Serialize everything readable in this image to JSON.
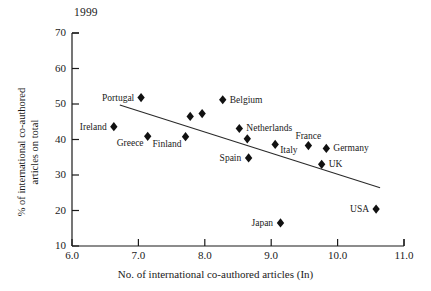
{
  "figure": {
    "year_title": "1999",
    "xlabel": "No. of international co-authored articles (In)",
    "ylabel": "% of international co-authored\narticles on total"
  },
  "chart_data": {
    "type": "scatter",
    "title": "1999",
    "xlabel": "No. of international co-authored articles (In)",
    "ylabel": "% of international co-authored articles on total",
    "xlim": [
      6.0,
      11.0
    ],
    "ylim": [
      10,
      70
    ],
    "xticks": [
      "6.0",
      "7.0",
      "8.0",
      "9.0",
      "10.0",
      "11.0"
    ],
    "yticks": [
      "10",
      "20",
      "30",
      "40",
      "50",
      "60",
      "70"
    ],
    "grid": false,
    "legend": "none",
    "points": [
      {
        "label": "Portugal",
        "x": 7.04,
        "y": 51.8,
        "label_pos": "left"
      },
      {
        "label": "Ireland",
        "x": 6.63,
        "y": 43.6,
        "label_pos": "left"
      },
      {
        "label": "Greece",
        "x": 7.14,
        "y": 40.9,
        "label_pos": "below-left"
      },
      {
        "label": "",
        "x": 7.78,
        "y": 46.5,
        "label_pos": "none"
      },
      {
        "label": "",
        "x": 7.96,
        "y": 47.3,
        "label_pos": "none"
      },
      {
        "label": "Finland",
        "x": 7.71,
        "y": 40.8,
        "label_pos": "below-left"
      },
      {
        "label": "Belgium",
        "x": 8.27,
        "y": 51.2,
        "label_pos": "right"
      },
      {
        "label": "Netherlands",
        "x": 8.52,
        "y": 43.1,
        "label_pos": "right"
      },
      {
        "label": "",
        "x": 8.64,
        "y": 40.2,
        "label_pos": "none"
      },
      {
        "label": "Spain",
        "x": 8.66,
        "y": 34.8,
        "label_pos": "left"
      },
      {
        "label": "Italy",
        "x": 9.06,
        "y": 38.6,
        "label_pos": "below-right"
      },
      {
        "label": "France",
        "x": 9.56,
        "y": 38.3,
        "label_pos": "above"
      },
      {
        "label": "Germany",
        "x": 9.83,
        "y": 37.5,
        "label_pos": "right"
      },
      {
        "label": "UK",
        "x": 9.76,
        "y": 33.0,
        "label_pos": "right"
      },
      {
        "label": "Japan",
        "x": 9.14,
        "y": 16.5,
        "label_pos": "left"
      },
      {
        "label": "USA",
        "x": 10.58,
        "y": 20.4,
        "label_pos": "left"
      }
    ],
    "trendline": {
      "x1": 6.72,
      "y1": 49.7,
      "x2": 10.64,
      "y2": 26.4
    }
  }
}
